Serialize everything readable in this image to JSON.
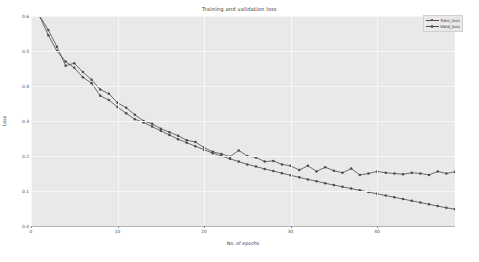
{
  "chart_data": {
    "type": "line",
    "title": "Training and validation loss",
    "xlabel": "No. of epochs",
    "ylabel": "Loss",
    "xlim": [
      0,
      49
    ],
    "ylim": [
      0.0,
      0.6
    ],
    "grid": true,
    "legend_position": "top-right",
    "xticks": [
      "0",
      "10",
      "20",
      "30",
      "40"
    ],
    "xtick_values": [
      0,
      10,
      20,
      30,
      40
    ],
    "yticks": [
      "0.0",
      "0.1",
      "0.2",
      "0.3",
      "0.4",
      "0.5",
      "0.6"
    ],
    "ytick_values": [
      0.0,
      0.1,
      0.2,
      0.3,
      0.4,
      0.5,
      0.6
    ],
    "x": [
      1,
      2,
      3,
      4,
      5,
      6,
      7,
      8,
      9,
      10,
      11,
      12,
      13,
      14,
      15,
      16,
      17,
      18,
      19,
      20,
      21,
      22,
      23,
      24,
      25,
      26,
      27,
      28,
      29,
      30,
      31,
      32,
      33,
      34,
      35,
      36,
      37,
      38,
      39,
      40,
      41,
      42,
      43,
      44,
      45,
      46,
      47,
      48,
      49
    ],
    "series": [
      {
        "name": "Train_loss",
        "color": "#4a4a4a",
        "marker": "circle",
        "values": [
          0.6,
          0.545,
          0.5,
          0.47,
          0.452,
          0.425,
          0.408,
          0.372,
          0.36,
          0.34,
          0.322,
          0.305,
          0.296,
          0.284,
          0.272,
          0.26,
          0.248,
          0.238,
          0.228,
          0.218,
          0.208,
          0.2,
          0.192,
          0.184,
          0.176,
          0.17,
          0.163,
          0.157,
          0.151,
          0.145,
          0.139,
          0.133,
          0.128,
          0.122,
          0.117,
          0.112,
          0.107,
          0.102,
          0.097,
          0.092,
          0.087,
          0.082,
          0.077,
          0.072,
          0.067,
          0.062,
          0.057,
          0.052,
          0.048
        ]
      },
      {
        "name": "Valid_loss",
        "color": "#4a4a4a",
        "marker": "circle",
        "values": [
          0.6,
          0.56,
          0.512,
          0.458,
          0.465,
          0.44,
          0.418,
          0.39,
          0.378,
          0.352,
          0.338,
          0.318,
          0.3,
          0.292,
          0.278,
          0.268,
          0.258,
          0.245,
          0.24,
          0.224,
          0.212,
          0.206,
          0.198,
          0.216,
          0.2,
          0.196,
          0.184,
          0.186,
          0.176,
          0.172,
          0.16,
          0.172,
          0.156,
          0.168,
          0.158,
          0.152,
          0.164,
          0.146,
          0.15,
          0.156,
          0.152,
          0.15,
          0.148,
          0.152,
          0.15,
          0.146,
          0.156,
          0.15,
          0.155
        ]
      }
    ]
  }
}
